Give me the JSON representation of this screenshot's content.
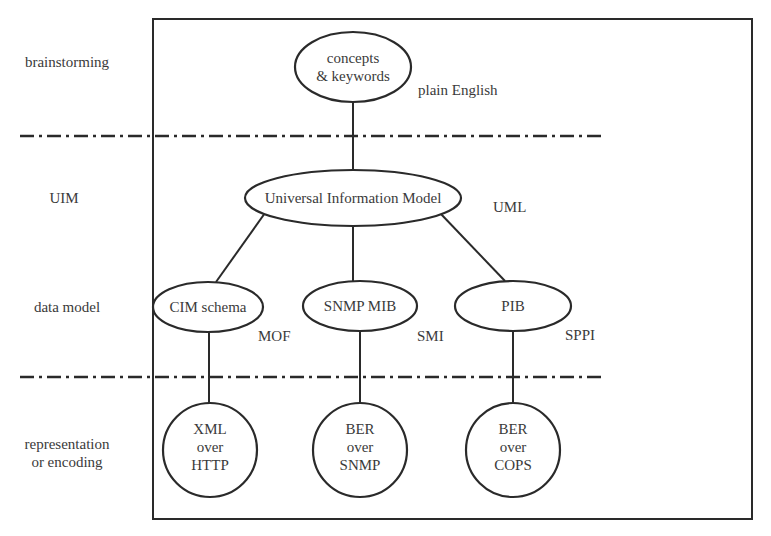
{
  "layers": [
    {
      "id": "brainstorming",
      "label_lines": [
        "brainstorming"
      ]
    },
    {
      "id": "uim",
      "label_lines": [
        "UIM"
      ]
    },
    {
      "id": "data-model",
      "label_lines": [
        "data model"
      ]
    },
    {
      "id": "representation",
      "label_lines": [
        "representation",
        "or encoding"
      ]
    }
  ],
  "nodes": {
    "concepts": {
      "lines": [
        "concepts",
        "& keywords"
      ],
      "language": "plain English"
    },
    "uim": {
      "lines": [
        "Universal Information Model"
      ],
      "language": "UML"
    },
    "cim": {
      "lines": [
        "CIM schema"
      ],
      "language": "MOF"
    },
    "snmp_mib": {
      "lines": [
        "SNMP MIB"
      ],
      "language": "SMI"
    },
    "pib": {
      "lines": [
        "PIB"
      ],
      "language": "SPPI"
    },
    "xml_http": {
      "lines": [
        "XML",
        "over",
        "HTTP"
      ]
    },
    "ber_snmp": {
      "lines": [
        "BER",
        "over",
        "SNMP"
      ]
    },
    "ber_cops": {
      "lines": [
        "BER",
        "over",
        "COPS"
      ]
    }
  },
  "edges": [
    [
      "concepts",
      "uim"
    ],
    [
      "uim",
      "cim"
    ],
    [
      "uim",
      "snmp_mib"
    ],
    [
      "uim",
      "pib"
    ],
    [
      "cim",
      "xml_http"
    ],
    [
      "snmp_mib",
      "ber_snmp"
    ],
    [
      "pib",
      "ber_cops"
    ]
  ],
  "colors": {
    "stroke": "#2a2a2a",
    "text": "#3a3a3a",
    "background": "#ffffff"
  }
}
